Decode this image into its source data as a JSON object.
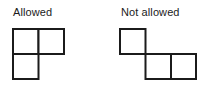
{
  "figure": {
    "background_color": "#ffffff",
    "stroke_color": "#1b1b1b",
    "stroke_width": 2,
    "cell_size": 25,
    "panels": [
      {
        "id": "allowed",
        "label": "Allowed",
        "label_position": {
          "x": 13,
          "y": 6
        },
        "shape_name": "L-tromino",
        "cells": [
          {
            "col": 0,
            "row": 0
          },
          {
            "col": 1,
            "row": 0
          },
          {
            "col": 0,
            "row": 1
          }
        ],
        "origin": {
          "x": 13,
          "y": 29
        },
        "description": "Three unit squares joined edge to edge forming an L shape"
      },
      {
        "id": "not-allowed",
        "label": "Not allowed",
        "label_position": {
          "x": 121,
          "y": 6
        },
        "shape_name": "corner-touching-tromino",
        "cells": [
          {
            "col": 0,
            "row": 0
          },
          {
            "col": 1,
            "row": 1
          },
          {
            "col": 2,
            "row": 1
          }
        ],
        "origin": {
          "x": 120,
          "y": 29
        },
        "description": "One unit square touching a domino only at a single corner point"
      }
    ]
  }
}
